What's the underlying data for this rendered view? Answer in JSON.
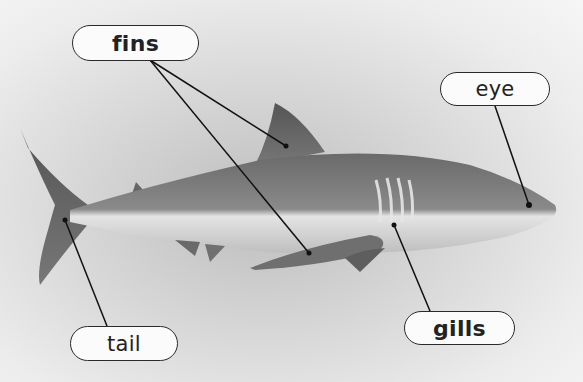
{
  "diagram": {
    "labels": [
      {
        "id": "fins",
        "text": "fins",
        "bold": true
      },
      {
        "id": "eye",
        "text": "eye",
        "bold": false
      },
      {
        "id": "gills",
        "text": "gills",
        "bold": true
      },
      {
        "id": "tail",
        "text": "tail",
        "bold": false
      }
    ]
  }
}
